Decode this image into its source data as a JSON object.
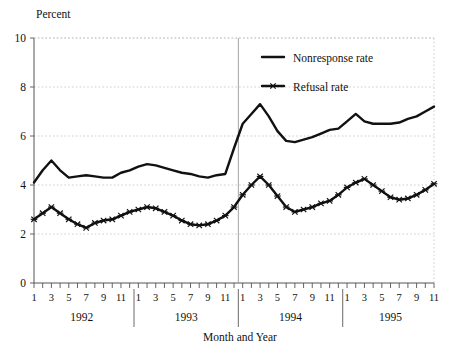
{
  "figure": {
    "y_axis_title": "Percent",
    "x_axis_title": "Month and Year"
  },
  "legend": {
    "position": "top-right-inside",
    "entries": [
      {
        "label": "Nonresponse rate",
        "style": "plain-line",
        "marker": "none",
        "color": "#111111"
      },
      {
        "label": "Refusal rate",
        "style": "line-with-markers",
        "marker": "x-cross",
        "color": "#111111"
      }
    ]
  },
  "axes": {
    "y_ticks": [
      "0",
      "2",
      "4",
      "6",
      "8",
      "10"
    ],
    "x_month_ticks": [
      "1",
      "3",
      "5",
      "7",
      "9",
      "11"
    ],
    "year_labels": [
      "1992",
      "1993",
      "1994",
      "1995"
    ]
  },
  "chart_data": {
    "type": "line",
    "title": "",
    "subtitle": "",
    "xlabel": "Month and Year",
    "ylabel": "Percent",
    "ylim": [
      0,
      10
    ],
    "ytick_values": [
      0,
      2,
      4,
      6,
      8,
      10
    ],
    "grid": "horizontal-dashed",
    "legend_position": "upper right inside plot",
    "x": [
      "1992-01",
      "1992-02",
      "1992-03",
      "1992-04",
      "1992-05",
      "1992-06",
      "1992-07",
      "1992-08",
      "1992-09",
      "1992-10",
      "1992-11",
      "1992-12",
      "1993-01",
      "1993-02",
      "1993-03",
      "1993-04",
      "1993-05",
      "1993-06",
      "1993-07",
      "1993-08",
      "1993-09",
      "1993-10",
      "1993-11",
      "1993-12",
      "1994-01",
      "1994-02",
      "1994-03",
      "1994-04",
      "1994-05",
      "1994-06",
      "1994-07",
      "1994-08",
      "1994-09",
      "1994-10",
      "1994-11",
      "1994-12",
      "1995-01",
      "1995-02",
      "1995-03",
      "1995-04",
      "1995-05",
      "1995-06",
      "1995-07",
      "1995-08",
      "1995-09",
      "1995-10",
      "1995-11"
    ],
    "x_tick_labels_visible": [
      "1",
      "3",
      "5",
      "7",
      "9",
      "11"
    ],
    "year_boundaries": [
      "1992|1993",
      "1993|1994",
      "1994|1995"
    ],
    "highlighted_boundary": "1993|1994",
    "series": [
      {
        "name": "Nonresponse rate",
        "marker": "none",
        "values": [
          4.1,
          4.6,
          5.0,
          4.6,
          4.3,
          4.35,
          4.4,
          4.35,
          4.3,
          4.3,
          4.5,
          4.6,
          4.75,
          4.85,
          4.8,
          4.7,
          4.6,
          4.5,
          4.45,
          4.35,
          4.3,
          4.4,
          4.45,
          5.5,
          6.5,
          6.9,
          7.3,
          6.8,
          6.2,
          5.8,
          5.75,
          5.85,
          5.95,
          6.1,
          6.25,
          6.3,
          6.6,
          6.9,
          6.6,
          6.5,
          6.5,
          6.5,
          6.55,
          6.7,
          6.8,
          7.0,
          7.2
        ]
      },
      {
        "name": "Refusal rate",
        "marker": "x-cross",
        "values": [
          2.6,
          2.85,
          3.1,
          2.85,
          2.6,
          2.4,
          2.25,
          2.45,
          2.55,
          2.6,
          2.75,
          2.9,
          3.0,
          3.1,
          3.05,
          2.9,
          2.75,
          2.55,
          2.4,
          2.35,
          2.4,
          2.55,
          2.75,
          3.1,
          3.6,
          4.0,
          4.35,
          4.0,
          3.55,
          3.1,
          2.9,
          3.0,
          3.1,
          3.25,
          3.35,
          3.6,
          3.9,
          4.1,
          4.25,
          4.0,
          3.75,
          3.5,
          3.4,
          3.45,
          3.6,
          3.8,
          4.05
        ]
      }
    ]
  }
}
